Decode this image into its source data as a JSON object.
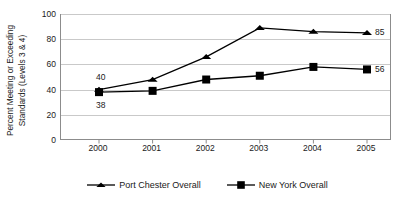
{
  "chart_data": {
    "type": "line",
    "title": "",
    "subtitle": "",
    "xlabel": "",
    "ylabel": "Percent Meeting or Exceeding Standards (Levels 3 & 4)",
    "ylabel_lines": [
      "Percent Meeting or Exceeding",
      "Standards (Levels 3 & 4)"
    ],
    "categories": [
      "2000",
      "2001",
      "2002",
      "2003",
      "2004",
      "2005"
    ],
    "x": [
      2000,
      2001,
      2002,
      2003,
      2004,
      2005
    ],
    "ylim": [
      0,
      100
    ],
    "yticks": [
      0,
      20,
      40,
      60,
      80,
      100
    ],
    "ytick_labels": [
      "0",
      "20",
      "40",
      "60",
      "80",
      "100"
    ],
    "grid": "horizontal",
    "legend_position": "bottom-center",
    "series": [
      {
        "name": "Port Chester Overall",
        "marker": "triangle",
        "color": "#000000",
        "values": [
          40,
          48,
          66,
          89,
          86,
          85
        ]
      },
      {
        "name": "New York Overall",
        "marker": "square",
        "color": "#000000",
        "values": [
          38,
          39,
          48,
          51,
          58,
          56
        ]
      }
    ],
    "annotations": [
      {
        "text": "40",
        "series": "Port Chester Overall",
        "x": "2000",
        "value": 40,
        "position": "above"
      },
      {
        "text": "38",
        "series": "New York Overall",
        "x": "2000",
        "value": 38,
        "position": "below"
      },
      {
        "text": "85",
        "series": "Port Chester Overall",
        "x": "2005",
        "value": 85,
        "position": "right"
      },
      {
        "text": "56",
        "series": "New York Overall",
        "x": "2005",
        "value": 56,
        "position": "right"
      }
    ]
  },
  "legend": {
    "items": [
      {
        "label": "Port Chester Overall",
        "marker": "triangle-marker-icon"
      },
      {
        "label": "New York Overall",
        "marker": "square-marker-icon"
      }
    ]
  }
}
